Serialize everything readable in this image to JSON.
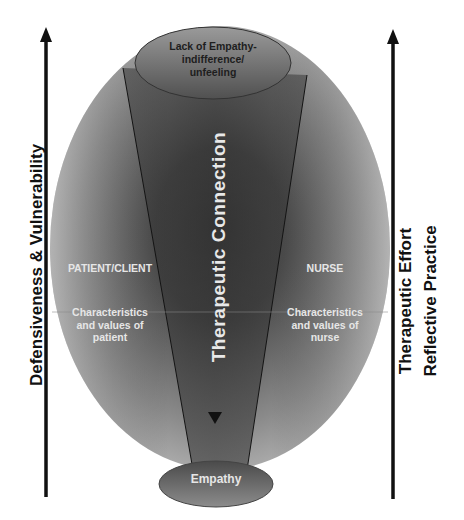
{
  "diagram": {
    "top_ellipse": {
      "label_lines": [
        "Lack of Empathy-",
        "indifference/",
        "unfeeling"
      ]
    },
    "bottom_ellipse": {
      "label": "Empathy"
    },
    "center_label": "Therapeutic Connection",
    "left_side": {
      "heading": "PATIENT/CLIENT",
      "description_lines": [
        "Characteristics",
        "and values of",
        "patient"
      ]
    },
    "right_side": {
      "heading": "NURSE",
      "description_lines": [
        "Characteristics",
        "and values of",
        "nurse"
      ]
    },
    "left_axis": {
      "label": "Defensiveness & Vulnerability",
      "direction": "up"
    },
    "right_axis": {
      "labels": [
        "Therapeutic Effort",
        "Reflective Practice"
      ],
      "direction": "up"
    },
    "colors": {
      "ellipse_light": "#b4b4b4",
      "ellipse_dark": "#3a3a3a",
      "arrow": "#111111",
      "text_light": "#e6e6e6",
      "text_dark": "#1e1e1e"
    }
  }
}
